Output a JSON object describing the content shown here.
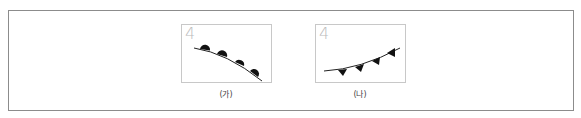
{
  "figure": {
    "panels": [
      {
        "number": "4",
        "caption": "(가)",
        "symbol": "semicircles"
      },
      {
        "number": "4",
        "caption": "(나)",
        "symbol": "triangles"
      }
    ],
    "colors": {
      "border": "#8c8c8c",
      "panel_border": "#c8c8c8",
      "line": "#222222",
      "number": "#bcbcbc"
    }
  }
}
